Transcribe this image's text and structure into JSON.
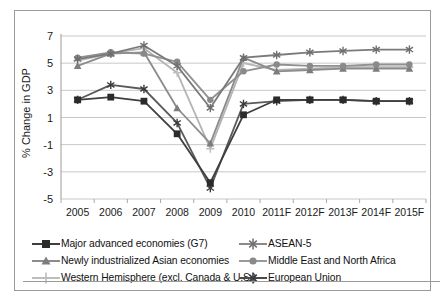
{
  "chart_data": {
    "type": "line",
    "title": "",
    "xlabel": "",
    "ylabel": "% Change in GDP",
    "grid": true,
    "legend_position": "bottom",
    "categories": [
      "2005",
      "2006",
      "2007",
      "2008",
      "2009",
      "2010",
      "2011F",
      "2012F",
      "2013F",
      "2014F",
      "2015F"
    ],
    "ylim": [
      -5,
      7
    ],
    "yticks": [
      7,
      5,
      3,
      1,
      -1,
      -3,
      -5
    ],
    "series": [
      {
        "name": "Major advanced economies (G7)",
        "marker": "square",
        "color": "#3f3f3f",
        "values": [
          2.3,
          2.5,
          2.2,
          -0.2,
          -3.8,
          1.2,
          2.3,
          2.3,
          2.3,
          2.2,
          2.2
        ]
      },
      {
        "name": "Newly industrialized Asian economies",
        "marker": "triangle",
        "color": "#8c8c8c",
        "values": [
          4.8,
          5.7,
          5.8,
          1.7,
          -0.9,
          5.4,
          4.4,
          4.5,
          4.6,
          4.6,
          4.6
        ]
      },
      {
        "name": "Western Hemisphere (excl. Canada & U.S.)",
        "marker": "plus",
        "color": "#b4b4b4",
        "values": [
          5.2,
          5.7,
          6.1,
          4.3,
          -1.3,
          5.0,
          4.5,
          4.6,
          4.7,
          4.7,
          4.7
        ]
      },
      {
        "name": "ASEAN-5",
        "marker": "asterisk",
        "color": "#7a7a7a",
        "values": [
          5.3,
          5.7,
          6.3,
          4.8,
          1.7,
          5.4,
          5.6,
          5.8,
          5.9,
          6.0,
          6.0
        ]
      },
      {
        "name": "Middle East and North Africa",
        "marker": "circle",
        "color": "#909090",
        "values": [
          5.4,
          5.8,
          5.7,
          5.1,
          2.3,
          4.4,
          4.9,
          4.8,
          4.8,
          4.9,
          4.9
        ]
      },
      {
        "name": "European Union",
        "marker": "star",
        "color": "#5a5a5a",
        "values": [
          2.3,
          3.4,
          3.1,
          0.6,
          -4.2,
          2.0,
          2.2,
          2.3,
          2.3,
          2.2,
          2.2
        ]
      }
    ]
  },
  "legend": {
    "column_a": [
      "Major advanced economies (G7)",
      "Newly industrialized Asian economies",
      "Western Hemisphere (excl. Canada & U.S.)"
    ],
    "column_b": [
      "ASEAN-5",
      "Middle East and North Africa",
      "European Union"
    ]
  }
}
